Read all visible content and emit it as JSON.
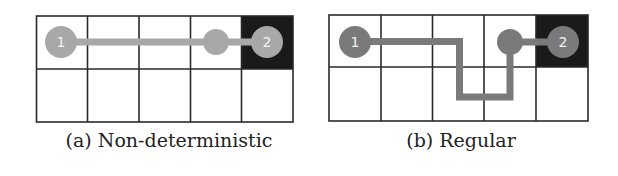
{
  "figure": {
    "panels": [
      {
        "id": "a",
        "caption": "(a) Non-deterministic",
        "grid": {
          "rows": 2,
          "cols": 5
        },
        "goal_cell": {
          "row": 0,
          "col": 4
        },
        "path_cells": [
          [
            0,
            0
          ],
          [
            0,
            1
          ],
          [
            0,
            2
          ],
          [
            0,
            3
          ],
          [
            0,
            4
          ]
        ],
        "nodes": [
          {
            "label": "1",
            "cell": [
              0,
              0
            ],
            "type": "start"
          },
          {
            "label": "",
            "cell": [
              0,
              3
            ],
            "type": "intermediate"
          },
          {
            "label": "2",
            "cell": [
              0,
              4
            ],
            "type": "end"
          }
        ],
        "path_color": "#a8a8a8"
      },
      {
        "id": "b",
        "caption": "(b) Regular",
        "grid": {
          "rows": 2,
          "cols": 5
        },
        "goal_cell": {
          "row": 0,
          "col": 4
        },
        "path_cells": [
          [
            0,
            0
          ],
          [
            0,
            1
          ],
          [
            0,
            2
          ],
          [
            1,
            2
          ],
          [
            1,
            3
          ],
          [
            0,
            3
          ],
          [
            0,
            4
          ]
        ],
        "nodes": [
          {
            "label": "1",
            "cell": [
              0,
              0
            ],
            "type": "start"
          },
          {
            "label": "",
            "cell": [
              0,
              3
            ],
            "type": "intermediate"
          },
          {
            "label": "2",
            "cell": [
              0,
              4
            ],
            "type": "end"
          }
        ],
        "path_color": "#7a7a7a"
      }
    ],
    "colors": {
      "grid_line": "#2a2a2a",
      "goal_cell_fill": "#1a1a1a",
      "node_label": "#f2f2f2",
      "background": "#ffffff"
    }
  }
}
